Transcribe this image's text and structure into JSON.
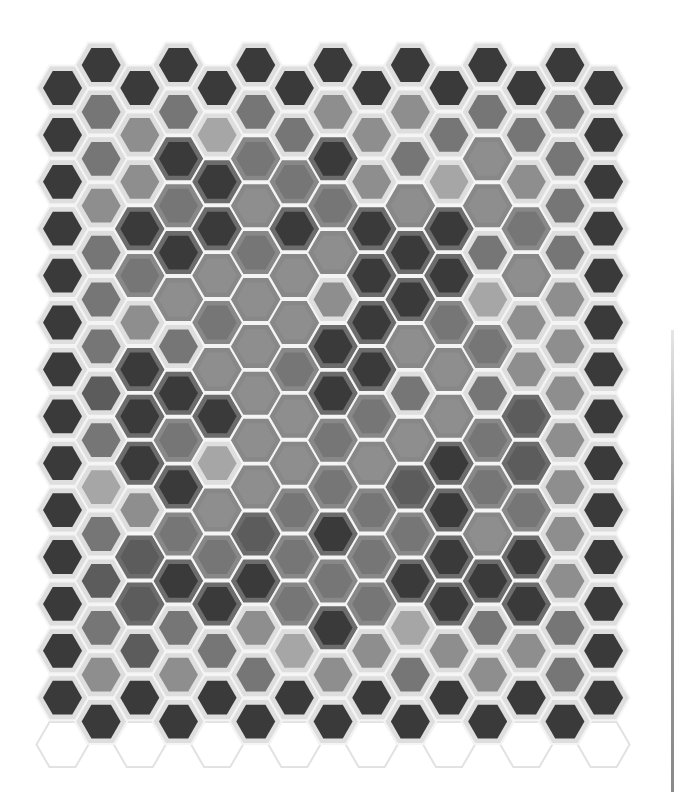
{
  "grid": {
    "columns": 15,
    "x0": 62.5,
    "dx": 38.65,
    "even_y0": 88,
    "odd_y0": 65,
    "dy": 46.9,
    "outer_radius": 26,
    "inner_radius": 19.5
  },
  "palette": {
    "inner": {
      "D": "#3a3a3a",
      "M": "#5c5c5c",
      "G": "#767676",
      "L": "#8e8e8e",
      "P": "#a6a6a6"
    },
    "outer": {
      "w": "#dedede",
      "g": "#6c6c6c",
      "h": "#888888"
    },
    "gap": "#f4f4f4",
    "ghost_stroke": "#e2e2e2"
  },
  "columns": [
    [
      "wD",
      "wD",
      "wD",
      "wD",
      "wD",
      "wD",
      "wD",
      "wD",
      "wD",
      "wD",
      "wD",
      "wD",
      "wD",
      "wD"
    ],
    [
      "wD",
      "wG",
      "wG",
      "wL",
      "wG",
      "wG",
      "wG",
      "wM",
      "wG",
      "wP",
      "wG",
      "wM",
      "wG",
      "wL",
      "wD"
    ],
    [
      "wD",
      "wL",
      "wL",
      "gD",
      "hG",
      "wL",
      "gD",
      "gD",
      "gD",
      "wL",
      "gM",
      "gM",
      "wM",
      "wD"
    ],
    [
      "wD",
      "wG",
      "gD",
      "hG",
      "gD",
      "hL",
      "wG",
      "gD",
      "hG",
      "gD",
      "hG",
      "gD",
      "wG",
      "wL",
      "wD"
    ],
    [
      "wD",
      "wP",
      "gD",
      "gD",
      "hL",
      "hG",
      "hL",
      "gD",
      "wP",
      "hL",
      "hG",
      "gD",
      "wG",
      "wD"
    ],
    [
      "wD",
      "wG",
      "hG",
      "hL",
      "hG",
      "hL",
      "hL",
      "hL",
      "hL",
      "hL",
      "gM",
      "gD",
      "wL",
      "wG",
      "wD"
    ],
    [
      "wD",
      "wG",
      "hG",
      "gD",
      "hL",
      "hL",
      "hG",
      "hL",
      "hL",
      "hG",
      "hG",
      "hG",
      "wP",
      "wD"
    ],
    [
      "wD",
      "wL",
      "gD",
      "hG",
      "hL",
      "wL",
      "gD",
      "gD",
      "hG",
      "hG",
      "gD",
      "hG",
      "gD",
      "wL",
      "wD"
    ],
    [
      "wD",
      "wL",
      "wL",
      "gD",
      "gD",
      "gD",
      "gD",
      "hG",
      "hL",
      "hG",
      "hG",
      "hG",
      "wL",
      "wD"
    ],
    [
      "wD",
      "wL",
      "wG",
      "hL",
      "gD",
      "gD",
      "hL",
      "wG",
      "hL",
      "gM",
      "hG",
      "gD",
      "wP",
      "wG",
      "wD"
    ],
    [
      "wD",
      "wG",
      "wP",
      "gD",
      "gD",
      "hG",
      "hL",
      "hL",
      "gD",
      "gD",
      "gD",
      "gD",
      "wL",
      "wD"
    ],
    [
      "wD",
      "wG",
      "hL",
      "hL",
      "wG",
      "wP",
      "hG",
      "wG",
      "hG",
      "hG",
      "hL",
      "gD",
      "wG",
      "wL",
      "wD"
    ],
    [
      "wD",
      "wG",
      "wL",
      "hG",
      "hL",
      "wL",
      "wL",
      "gM",
      "gM",
      "hG",
      "gD",
      "gD",
      "wL",
      "wD"
    ],
    [
      "wD",
      "wG",
      "wG",
      "wG",
      "wG",
      "wL",
      "wL",
      "wL",
      "wL",
      "wL",
      "wL",
      "wL",
      "wG",
      "wG",
      "wD"
    ],
    [
      "wD",
      "wD",
      "wD",
      "wD",
      "wD",
      "wD",
      "wD",
      "wD",
      "wD",
      "wD",
      "wD",
      "wD",
      "wD",
      "wD"
    ]
  ],
  "ghost_rows": {
    "even_y": 746,
    "odd_top_y": 41
  }
}
